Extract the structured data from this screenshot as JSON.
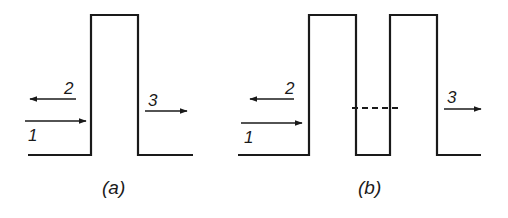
{
  "figure": {
    "panels": [
      {
        "id": "a",
        "caption": "(a)",
        "description": "single rectangular potential barrier",
        "barriers": [
          {
            "x_left": 91,
            "x_right": 138
          }
        ],
        "labels": {
          "incident": "1",
          "reflected": "2",
          "transmitted": "3"
        }
      },
      {
        "id": "b",
        "caption": "(b)",
        "description": "double rectangular potential barrier with dashed energy level in the well",
        "barriers": [
          {
            "x_left": 309,
            "x_right": 356
          },
          {
            "x_left": 390,
            "x_right": 437
          }
        ],
        "dashed_level": true,
        "labels": {
          "incident": "1",
          "reflected": "2",
          "transmitted": "3"
        }
      }
    ],
    "colors": {
      "line": "#1a1a1a",
      "background": "#ffffff"
    }
  }
}
